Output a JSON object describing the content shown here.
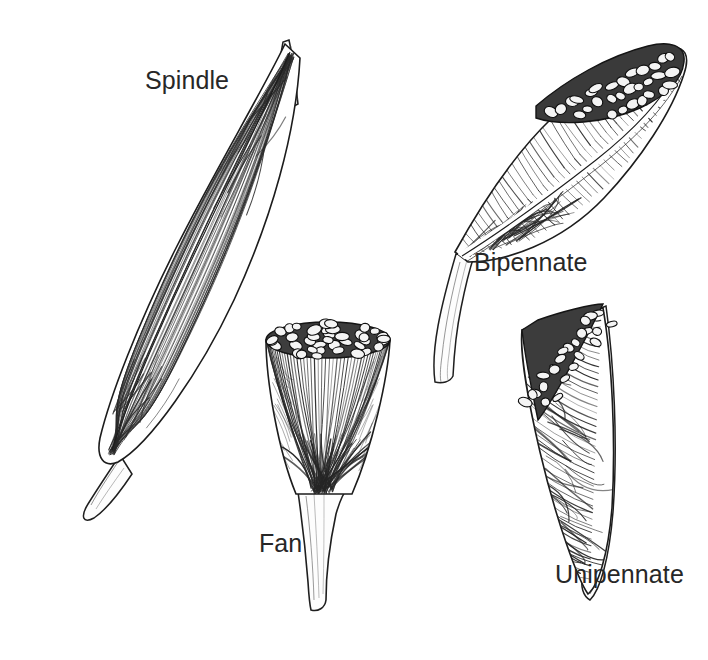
{
  "figure": {
    "background_color": "#ffffff",
    "ink_color": "#1a1a1a",
    "label_color": "#272727",
    "style": "pen-and-ink anatomical line drawing",
    "width": 708,
    "height": 660
  },
  "labels": {
    "spindle": "Spindle",
    "bipennate": "Bipennate",
    "fan": "Fan",
    "unipennate": "Unipennate"
  },
  "specimens": [
    {
      "name": "spindle",
      "label": "Spindle",
      "label_x": 145,
      "label_y": 68,
      "description": "Fusiform muscle belly oriented diagonally from upper right to lower left, with a narrow tendon at each end and long parallel fibers running the full length.",
      "tendon_count": 2,
      "fiber_direction": "longitudinal-parallel",
      "cut_surface": false
    },
    {
      "name": "bipennate",
      "label": "Bipennate",
      "label_x": 474,
      "label_y": 250,
      "description": "Two oblique fiber groups converging from opposite sides onto a central tendon, shown cut across the top revealing a fascicle mosaic.",
      "tendon_count": 1,
      "fiber_direction": "oblique-double",
      "cut_surface": true
    },
    {
      "name": "fan",
      "label": "Fan",
      "label_x": 259,
      "label_y": 531,
      "description": "Inverted cone: broad elliptical cut top with fascicle mosaic, fibers radiating downward and converging into a single narrow tendon.",
      "tendon_count": 1,
      "fiber_direction": "radiating-convergent",
      "cut_surface": true
    },
    {
      "name": "unipennate",
      "label": "Unipennate",
      "label_x": 555,
      "label_y": 562,
      "description": "Fibers attach obliquely along one side only of a tendon that runs down the right border and continues below the belly.",
      "tendon_count": 1,
      "fiber_direction": "oblique-single",
      "cut_surface": true
    }
  ]
}
